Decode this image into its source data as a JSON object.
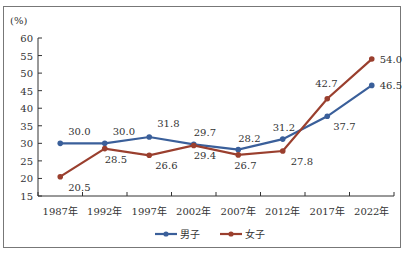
{
  "chart_data": {
    "type": "line",
    "title": "",
    "ylabel": "(%)",
    "xlabel": "",
    "categories": [
      "1987年",
      "1992年",
      "1997年",
      "2002年",
      "2007年",
      "2012年",
      "2017年",
      "2022年"
    ],
    "series": [
      {
        "name": "男子",
        "color": "#3a5f9a",
        "values": [
          30.0,
          30.0,
          31.8,
          29.7,
          28.2,
          31.2,
          37.7,
          46.5
        ]
      },
      {
        "name": "女子",
        "color": "#9a3f2e",
        "values": [
          20.5,
          28.5,
          26.6,
          29.4,
          26.7,
          27.8,
          42.7,
          54.0
        ]
      }
    ],
    "yticks": [
      15,
      20,
      25,
      30,
      35,
      40,
      45,
      50,
      55,
      60
    ],
    "ylim": [
      15,
      60
    ],
    "grid": false,
    "legend_position": "bottom"
  },
  "legend": {
    "male": "男子",
    "female": "女子"
  }
}
